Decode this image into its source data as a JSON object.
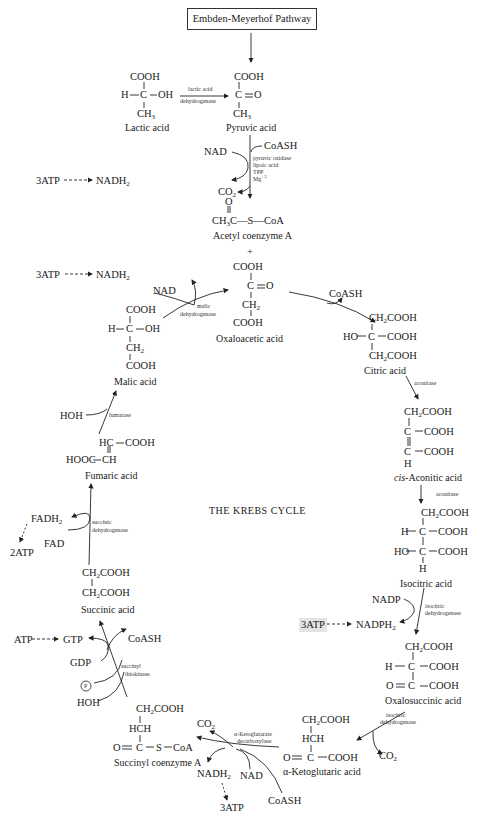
{
  "diagram": {
    "title": "THE KREBS CYCLE",
    "entry_box": "Embden-Meyerhof Pathway",
    "compounds": {
      "lactic_acid": {
        "name": "Lactic acid",
        "lines": [
          "COOH",
          "H—C—OH",
          "CH3"
        ]
      },
      "pyruvic_acid": {
        "name": "Pyruvic acid",
        "lines": [
          "COOH",
          "C=O",
          "CH3"
        ]
      },
      "acetyl_coa": {
        "name": "Acetyl coenzyme A",
        "lines": [
          "O",
          "CH3C—S—CoA"
        ]
      },
      "oxaloacetic_acid": {
        "name": "Oxaloacetic acid",
        "lines": [
          "COOH",
          "C=O",
          "CH2",
          "COOH"
        ]
      },
      "citric_acid": {
        "name": "Citric acid",
        "lines": [
          "CH2COOH",
          "HO—C—COOH",
          "CH2COOH"
        ]
      },
      "cis_aconitic_acid": {
        "name": "cis-Aconitic acid",
        "lines": [
          "CH2COOH",
          "C—COOH",
          "C—COOH",
          "H"
        ]
      },
      "isocitric_acid": {
        "name": "Isocitric acid",
        "lines": [
          "CH2COOH",
          "H—C—COOH",
          "HO—C—COOH",
          "H"
        ]
      },
      "oxalosuccinic_acid": {
        "name": "Oxalosuccinic acid",
        "lines": [
          "CH2COOH",
          "H—C—COOH",
          "O=C—COOH"
        ]
      },
      "alpha_ketoglutaric_acid": {
        "name": "α-Ketoglutaric acid",
        "lines": [
          "CH2COOH",
          "HCH",
          "O=C—COOH"
        ]
      },
      "succinyl_coa": {
        "name": "Succinyl coenzyme A",
        "lines": [
          "CH2COOH",
          "HCH",
          "O=C—S—CoA"
        ]
      },
      "succinic_acid": {
        "name": "Succinic acid",
        "lines": [
          "CH2COOH",
          "CH2COOH"
        ]
      },
      "fumaric_acid": {
        "name": "Fumaric acid",
        "lines": [
          "HC—COOH",
          "HOOC—CH"
        ]
      },
      "malic_acid": {
        "name": "Malic acid",
        "lines": [
          "COOH",
          "H—C—OH",
          "CH2",
          "COOH"
        ]
      }
    },
    "enzymes": {
      "ldh": [
        "lactic acid",
        "dehydrogenase"
      ],
      "pyruvic_oxidase": [
        "pyruvic oxidase",
        "lipoic acid",
        "TPP",
        "Mg+2"
      ],
      "malic_dh": [
        "malic",
        "dehydrogenase"
      ],
      "aconitase_1": "aconitase",
      "aconitase_2": "aconitase",
      "isocitric_dh_1": [
        "isocitric",
        "dehydrogenase"
      ],
      "isocitric_dh_2": [
        "isocitric",
        "dehydrogenase"
      ],
      "akg_decarboxylase": [
        "α-Ketoglutarate",
        "decarboxylase"
      ],
      "succinyl_thiokinase": [
        "succinyl",
        "thiokinase"
      ],
      "succinic_dh": [
        "succinic",
        "dehydrogenase"
      ],
      "fumarase": "fumarase"
    },
    "cofactors": {
      "plus": "+",
      "nad": "NAD",
      "nadh2": "NADH2",
      "coash": "CoASH",
      "co2": "CO2",
      "atp3": "3ATP",
      "nadp": "NADP",
      "nadph2": "NADPH2",
      "atp": "ATP",
      "gtp": "GTP",
      "gdp": "GDP",
      "p": "P",
      "hoh": "HOH",
      "fadh2": "FADH2",
      "fad": "FAD",
      "atp2": "2ATP"
    }
  }
}
